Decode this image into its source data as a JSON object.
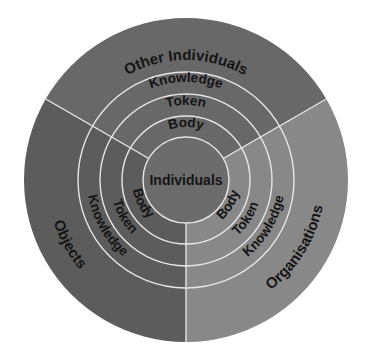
{
  "diagram": {
    "type": "concentric-sector-diagram",
    "center": {
      "label": "Individuals",
      "color": "#6c6c6c"
    },
    "rings": [
      "Body",
      "Token",
      "Knowledge"
    ],
    "sectors": [
      {
        "id": "top",
        "label": "Other Individuals",
        "color": "#686868",
        "rings": {
          "body": "Body",
          "token": "Token",
          "knowledge": "Knowledge"
        }
      },
      {
        "id": "left",
        "label": "Objects",
        "color": "#5c5c5c",
        "rings": {
          "body": "Body",
          "token": "Token",
          "knowledge": "Knowledge"
        }
      },
      {
        "id": "right",
        "label": "Organisations",
        "color": "#888888",
        "rings": {
          "body": "Body",
          "token": "Token",
          "knowledge": "Knowledge"
        }
      }
    ],
    "line_color": "#e6e6e6",
    "text_color": "#151515"
  }
}
